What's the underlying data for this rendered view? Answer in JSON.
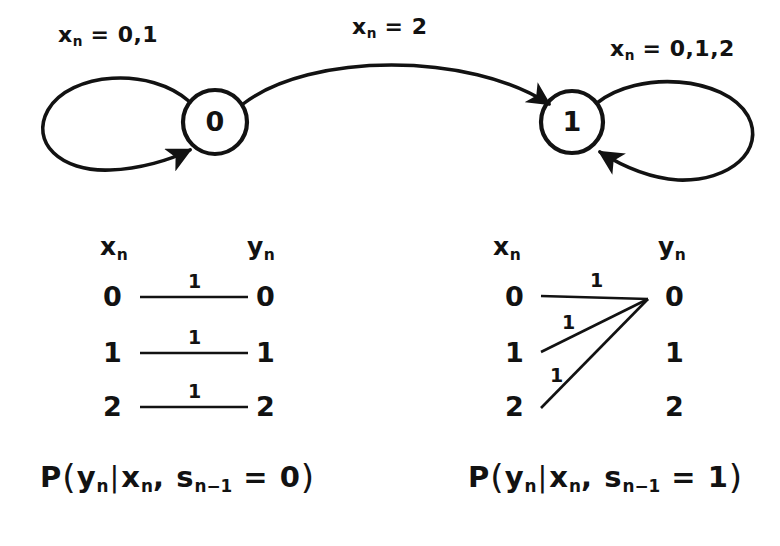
{
  "figure": {
    "background": "#ffffff",
    "ink": "#121212"
  },
  "state_diagram": {
    "states": [
      {
        "id": "s0",
        "label": "0",
        "cx": 215,
        "cy": 122,
        "r": 32
      },
      {
        "id": "s1",
        "label": "1",
        "cx": 572,
        "cy": 122,
        "r": 31
      }
    ],
    "transitions": [
      {
        "name": "self-loop-state-0",
        "from": "0",
        "to": "0",
        "label_prefix": "x",
        "label_sub": "n",
        "label_eq": "= 0,1",
        "label_text": "x n = 0,1"
      },
      {
        "name": "transition-0-to-1",
        "from": "0",
        "to": "1",
        "label_prefix": "x",
        "label_sub": "n",
        "label_eq": "= 2",
        "label_text": "x n = 2"
      },
      {
        "name": "self-loop-state-1",
        "from": "1",
        "to": "1",
        "label_prefix": "x",
        "label_sub": "n",
        "label_eq": "= 0,1,2",
        "label_text": "x n = 0,1,2"
      }
    ]
  },
  "trellises": [
    {
      "name": "trellis-state-0",
      "input_header": {
        "base": "x",
        "sub": "n"
      },
      "output_header": {
        "base": "y",
        "sub": "n"
      },
      "inputs": [
        "0",
        "1",
        "2"
      ],
      "outputs": [
        "0",
        "1",
        "2"
      ],
      "edges": [
        {
          "from": "0",
          "to": "0",
          "prob": "1"
        },
        {
          "from": "1",
          "to": "1",
          "prob": "1"
        },
        {
          "from": "2",
          "to": "2",
          "prob": "1"
        }
      ],
      "caption": {
        "p": "P",
        "open": "(",
        "y": "y",
        "y_sub": "n",
        "bar": "|",
        "x": "x",
        "x_sub": "n",
        "comma": ",",
        "s": "s",
        "s_sub": "n−1",
        "eq": "= 0",
        "close": ")",
        "text": "P ( y_n | x_n , s_n-1 = 0 )"
      }
    },
    {
      "name": "trellis-state-1",
      "input_header": {
        "base": "x",
        "sub": "n"
      },
      "output_header": {
        "base": "y",
        "sub": "n"
      },
      "inputs": [
        "0",
        "1",
        "2"
      ],
      "outputs": [
        "0",
        "1",
        "2"
      ],
      "edges": [
        {
          "from": "0",
          "to": "0",
          "prob": "1"
        },
        {
          "from": "1",
          "to": "0",
          "prob": "1"
        },
        {
          "from": "2",
          "to": "0",
          "prob": "1"
        }
      ],
      "caption": {
        "p": "P",
        "open": "(",
        "y": "y",
        "y_sub": "n",
        "bar": "|",
        "x": "x",
        "x_sub": "n",
        "comma": ",",
        "s": "s",
        "s_sub": "n−1",
        "eq": "= 1",
        "close": ")",
        "text": "P ( y_n | x_n , s_n-1 = 1 )"
      }
    }
  ]
}
